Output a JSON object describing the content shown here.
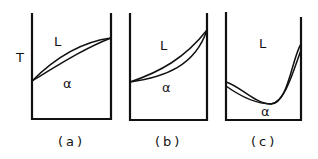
{
  "figure": {
    "y_axis_label": "T",
    "panels": [
      {
        "caption": "(a)",
        "upper_region_label": "L",
        "lower_region_label": "α",
        "shape": "two-phase lens, monotonic increasing, concave down"
      },
      {
        "caption": "(b)",
        "upper_region_label": "L",
        "lower_region_label": "α",
        "shape": "two-phase lens, monotonic increasing, concave up"
      },
      {
        "caption": "(c)",
        "upper_region_label": "L",
        "lower_region_label": "α",
        "shape": "two-phase lens with congruent minimum"
      }
    ]
  }
}
